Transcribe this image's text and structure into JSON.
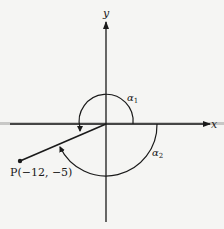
{
  "diagram": {
    "axes": {
      "x_label": "x",
      "y_label": "y"
    },
    "point": {
      "label": "P(−12, −5)",
      "x": -12,
      "y": -5
    },
    "angles": [
      {
        "label": "α",
        "subscript": "1",
        "direction": "counterclockwise"
      },
      {
        "label": "α",
        "subscript": "2",
        "direction": "clockwise"
      }
    ],
    "colors": {
      "line": "#1a1a1a",
      "background": "#f5f5f3",
      "axis_shadow": "#b0b0b0"
    }
  }
}
